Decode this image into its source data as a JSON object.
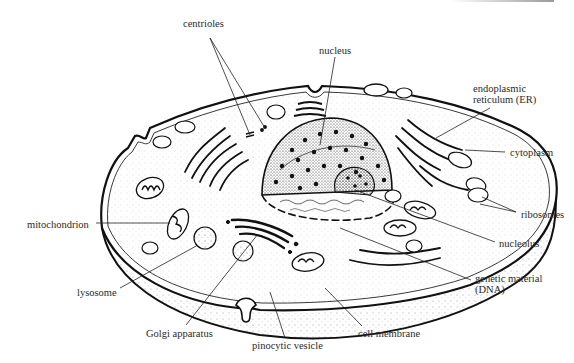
{
  "diagram": {
    "colors": {
      "ink": "#1a1a1a",
      "label": "#2a2a2a",
      "background": "#ffffff"
    },
    "labels": [
      {
        "id": "centrioles",
        "text": "centrioles",
        "x": 183,
        "y": 18
      },
      {
        "id": "nucleus",
        "text": "nucleus",
        "x": 319,
        "y": 45
      },
      {
        "id": "er",
        "text": "endoplasmic",
        "text2": "reticulum (ER)",
        "x": 473,
        "y": 83
      },
      {
        "id": "cytoplasm",
        "text": "cytoplasm",
        "x": 510,
        "y": 147
      },
      {
        "id": "ribosomes",
        "text": "ribosomes",
        "x": 521,
        "y": 209
      },
      {
        "id": "mitochondrion",
        "text": "mitochondrion",
        "x": 27,
        "y": 219
      },
      {
        "id": "nucleolus",
        "text": "nucleolus",
        "x": 499,
        "y": 238
      },
      {
        "id": "genetic-material",
        "text": "genetic material",
        "text2": "(DNA)",
        "x": 475,
        "y": 273
      },
      {
        "id": "lysosome",
        "text": "lysosome",
        "x": 77,
        "y": 287
      },
      {
        "id": "golgi",
        "text": "Golgi apparatus",
        "x": 146,
        "y": 328
      },
      {
        "id": "cell-membrane",
        "text": "cell membrane",
        "x": 358,
        "y": 328
      },
      {
        "id": "pinocytic-vesicle",
        "text": "pinocytic vesicle",
        "x": 252,
        "y": 340
      }
    ]
  }
}
